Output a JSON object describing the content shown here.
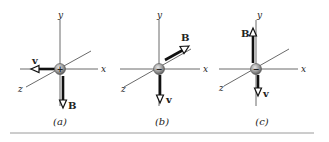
{
  "figure": {
    "panels": [
      {
        "caption": "(a)",
        "particle_charge": "+",
        "axes": {
          "x": "x",
          "y": "y",
          "z": "z"
        },
        "vectors": [
          {
            "name": "v",
            "direction": "-x"
          },
          {
            "name": "B",
            "direction": "-y"
          }
        ]
      },
      {
        "caption": "(b)",
        "particle_charge": "−",
        "axes": {
          "x": "x",
          "y": "y",
          "z": "z"
        },
        "vectors": [
          {
            "name": "B",
            "direction": "-z"
          },
          {
            "name": "v",
            "direction": "-y"
          }
        ]
      },
      {
        "caption": "(c)",
        "particle_charge": "−",
        "axes": {
          "x": "x",
          "y": "y",
          "z": "z"
        },
        "vectors": [
          {
            "name": "B",
            "direction": "+y"
          },
          {
            "name": "v",
            "direction": "-y"
          }
        ]
      }
    ],
    "colors": {
      "ink": "#111111",
      "axis": "#444444",
      "particle_light": "#d8d8d8",
      "particle_dark": "#6e6e6e",
      "rule": "#9a9a9a"
    }
  }
}
